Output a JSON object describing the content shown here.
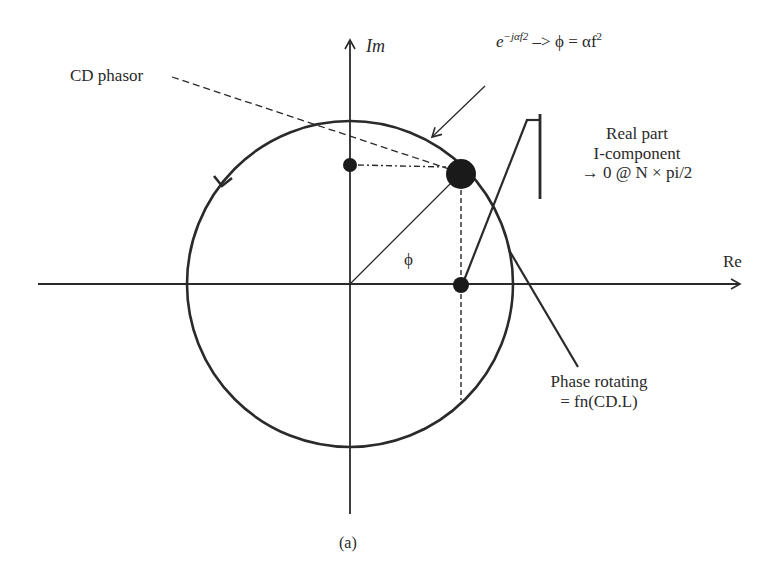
{
  "figure": {
    "caption": "(a)",
    "axes": {
      "imaginary_label": "Im",
      "real_label": "Re"
    },
    "angle_label": "ϕ",
    "labels": {
      "cd_phasor": "CD phasor",
      "formula_base": "e",
      "formula_exponent": "−jαf2",
      "formula_rest": " –> ϕ = αf",
      "formula_rest_exp": "2",
      "real_part_line1": "Real part",
      "real_part_line2": "I-component",
      "real_part_line3": "→ 0 @ N × pi/2",
      "phase_rotating_line1": "Phase rotating",
      "phase_rotating_line2": "= fn(CD.L)"
    },
    "colors": {
      "stroke": "#2a2a2a",
      "background": "#ffffff"
    }
  }
}
